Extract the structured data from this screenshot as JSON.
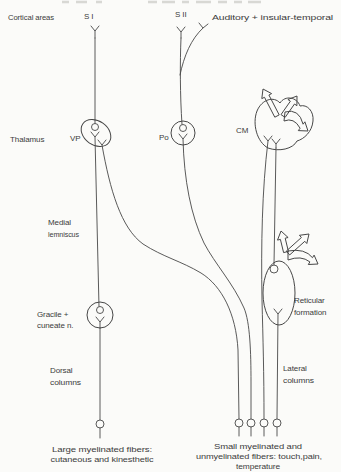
{
  "figure": {
    "colors": {
      "background": "#fbfbf9",
      "ink": "#3c3c3c"
    },
    "labels": {
      "cortical_areas": "Cortical areas",
      "s1": "S I",
      "s2": "S II",
      "auditory": "Auditory + insular-temporal",
      "thalamus": "Thalamus",
      "vp": "VP",
      "po": "Po",
      "cm": "CM",
      "medial_lemniscus_line1": "Medial",
      "medial_lemniscus_line2": "lemniscus",
      "gracile_line1": "Gracile +",
      "gracile_line2": "cuneate n.",
      "dorsal_line1": "Dorsal",
      "dorsal_line2": "columns",
      "lateral_line1": "Lateral",
      "lateral_line2": "columns",
      "reticular_line1": "Reticular",
      "reticular_line2": "formation",
      "caption_left_line1": "Large myelinated fibers:",
      "caption_left_line2": "cutaneous and kinesthetic",
      "caption_right_line1": "Small myelinated and",
      "caption_right_line2": "unmyelinated fibers: touch,pain,",
      "caption_right_line3": "temperature"
    }
  }
}
